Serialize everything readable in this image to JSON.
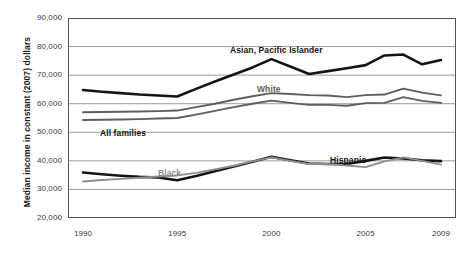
{
  "chart_data": {
    "type": "line",
    "title": "",
    "xlabel": "",
    "ylabel": "Median income in constant (2007) dollars",
    "xlim": [
      1990,
      2009
    ],
    "ylim": [
      20000,
      90000
    ],
    "grid": true,
    "legend_position": "inline-annotations",
    "x": [
      1990,
      1991,
      1992,
      1993,
      1994,
      1995,
      1996,
      1997,
      1998,
      1999,
      2000,
      2001,
      2002,
      2003,
      2004,
      2005,
      2006,
      2007,
      2008,
      2009
    ],
    "ytick_labels": [
      "90,000",
      "80,000",
      "70,000",
      "60,000",
      "50,000",
      "40,000",
      "30,000",
      "20,000"
    ],
    "ytick_values": [
      90000,
      80000,
      70000,
      60000,
      50000,
      40000,
      30000,
      20000
    ],
    "xtick_labels": [
      "1990",
      "1995",
      "2000",
      "2005",
      "2009"
    ],
    "xtick_values": [
      1990,
      1995,
      2000,
      2005,
      2009
    ],
    "series": [
      {
        "name": "Asian, Pacific Islander",
        "color": "#141414",
        "width": 2.6,
        "label_x": 230,
        "label_y": 45,
        "label_class": "lbl-dark",
        "values": [
          64800,
          64200,
          63700,
          63200,
          62900,
          62500,
          65200,
          67800,
          70200,
          72700,
          75600,
          73000,
          70400,
          71400,
          72400,
          73500,
          76900,
          77200,
          73800,
          75300
        ]
      },
      {
        "name": "White",
        "color": "#5e5e5e",
        "width": 1.9,
        "label_x": 257,
        "label_y": 84,
        "label_class": "lbl-mid",
        "values": [
          57000,
          57100,
          57200,
          57300,
          57400,
          57600,
          58800,
          60000,
          61400,
          62600,
          63700,
          63400,
          63000,
          62900,
          62300,
          63000,
          63200,
          65300,
          63900,
          62900
        ]
      },
      {
        "name": "All families",
        "color": "#5e5e5e",
        "width": 1.9,
        "label_x": 100,
        "label_y": 128,
        "label_class": "lbl-dark",
        "values": [
          54300,
          54400,
          54500,
          54600,
          54800,
          55000,
          56200,
          57500,
          58800,
          60000,
          61100,
          60300,
          59600,
          59600,
          59300,
          60200,
          60300,
          62300,
          61000,
          60300
        ]
      },
      {
        "name": "Hispanic",
        "color": "#141414",
        "width": 2.6,
        "label_x": 330,
        "label_y": 155,
        "label_class": "lbl-dark",
        "values": [
          35900,
          35300,
          34800,
          34400,
          34200,
          33200,
          34700,
          36400,
          38000,
          39700,
          41400,
          40200,
          39100,
          38900,
          38900,
          40000,
          41200,
          40800,
          40200,
          39900
        ]
      },
      {
        "name": "Black",
        "color": "#8d8d8d",
        "width": 1.9,
        "label_x": 158,
        "label_y": 168,
        "label_class": "lbl-gray",
        "values": [
          32800,
          33300,
          33700,
          34100,
          34500,
          34900,
          35800,
          37000,
          38300,
          39800,
          41200,
          40000,
          38900,
          38900,
          38400,
          37800,
          39800,
          41200,
          40000,
          38700
        ]
      }
    ]
  }
}
